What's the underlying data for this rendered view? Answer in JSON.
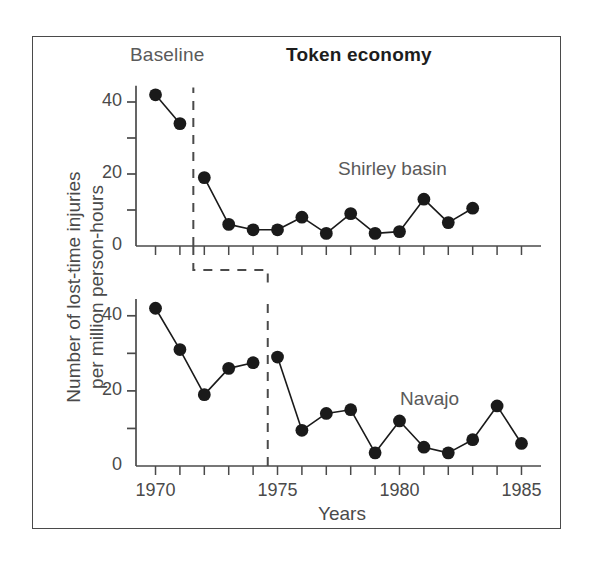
{
  "figure": {
    "frame_visible": true,
    "background": "#ffffff",
    "ink_color": "#4a4a4a",
    "marker_color": "#1a1a1a"
  },
  "axis_titles": {
    "y": "Number of lost-time injuries\nper million person-hours",
    "y_line1": "Number of lost-time injuries",
    "y_line2": "per million person-hours",
    "x": "Years"
  },
  "phase_labels": {
    "baseline": "Baseline",
    "intervention": "Token economy"
  },
  "series_labels": {
    "top": "Shirley basin",
    "bottom": "Navajo"
  },
  "y_ticks_labeled": [
    "0",
    "20",
    "40"
  ],
  "y_ticks_minor": [
    "10",
    "30"
  ],
  "x_ticks_labeled": [
    "1970",
    "1975",
    "1980",
    "1985"
  ],
  "chart_data": [
    {
      "type": "line",
      "title": "Shirley basin",
      "panel": "top",
      "xlabel": "Years",
      "ylabel": "Number of lost-time injuries per million person-hours",
      "xlim": [
        1969.2,
        1985.8
      ],
      "ylim": [
        0,
        45
      ],
      "yticks": [
        0,
        10,
        20,
        30,
        40
      ],
      "ytick_labels": [
        "0",
        "",
        "20",
        "",
        "40"
      ],
      "xticks": [
        1970,
        1971,
        1972,
        1973,
        1974,
        1975,
        1976,
        1977,
        1978,
        1979,
        1980,
        1981,
        1982,
        1983,
        1984,
        1985
      ],
      "xtick_labels": [
        "1970",
        "",
        "",
        "",
        "",
        "1975",
        "",
        "",
        "",
        "",
        "1980",
        "",
        "",
        "",
        "",
        "1985"
      ],
      "grid": false,
      "legend": "inline-annotation",
      "phase_change_x": 1971.55,
      "phases": [
        {
          "name": "Baseline",
          "x_range": [
            1969.2,
            1971.55
          ]
        },
        {
          "name": "Token economy",
          "x_range": [
            1971.55,
            1985.8
          ]
        }
      ],
      "x": [
        1970,
        1971,
        1972,
        1973,
        1974,
        1975,
        1976,
        1977,
        1978,
        1979,
        1980,
        1981,
        1982,
        1983
      ],
      "values": [
        42,
        34,
        19,
        6,
        4.5,
        4.5,
        8,
        3.5,
        9,
        3.5,
        4,
        13,
        6.5,
        10.5
      ],
      "series_breaks": [
        2
      ]
    },
    {
      "type": "line",
      "title": "Navajo",
      "panel": "bottom",
      "xlabel": "Years",
      "ylabel": "Number of lost-time injuries per million person-hours",
      "xlim": [
        1969.2,
        1985.8
      ],
      "ylim": [
        0,
        45
      ],
      "yticks": [
        0,
        10,
        20,
        30,
        40
      ],
      "ytick_labels": [
        "0",
        "",
        "20",
        "",
        "40"
      ],
      "xticks": [
        1970,
        1971,
        1972,
        1973,
        1974,
        1975,
        1976,
        1977,
        1978,
        1979,
        1980,
        1981,
        1982,
        1983,
        1984,
        1985
      ],
      "xtick_labels": [
        "1970",
        "",
        "",
        "",
        "",
        "1975",
        "",
        "",
        "",
        "",
        "1980",
        "",
        "",
        "",
        "",
        "1985"
      ],
      "grid": false,
      "legend": "inline-annotation",
      "phase_change_x": 1974.6,
      "phases": [
        {
          "name": "Baseline",
          "x_range": [
            1969.2,
            1974.6
          ]
        },
        {
          "name": "Token economy",
          "x_range": [
            1974.6,
            1985.8
          ]
        }
      ],
      "x": [
        1970,
        1971,
        1972,
        1973,
        1974,
        1975,
        1976,
        1977,
        1978,
        1979,
        1980,
        1981,
        1982,
        1983,
        1984,
        1985
      ],
      "values": [
        42,
        31,
        19,
        26,
        27.5,
        29,
        9.5,
        14,
        15,
        3.5,
        12,
        5,
        3.5,
        7,
        16,
        6
      ],
      "series_breaks": [
        5
      ]
    }
  ]
}
